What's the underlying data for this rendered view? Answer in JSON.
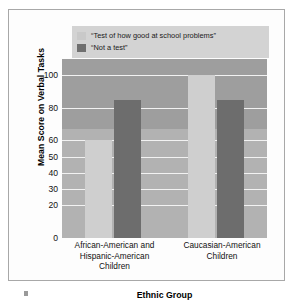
{
  "chart_data": {
    "type": "bar",
    "title": "",
    "xlabel": "Ethnic Group",
    "ylabel": "Mean Score on Verbal Tasks",
    "categories": [
      "African-American and Hispanic-American Children",
      "Caucasian-American Children"
    ],
    "category_lines": [
      [
        "African-American and",
        "Hispanic-American",
        "Children"
      ],
      [
        "Caucasian-American",
        "Children"
      ]
    ],
    "series": [
      {
        "name": "“Test of how good at school problems”",
        "color": "#cfcfcf",
        "values": [
          60,
          100
        ]
      },
      {
        "name": "“Not a test”",
        "color": "#6d6d6d",
        "values": [
          85,
          85
        ]
      }
    ],
    "ylim": [
      0,
      110
    ],
    "yticks": [
      0,
      20,
      30,
      40,
      50,
      60,
      80,
      100
    ],
    "ytick_labels": [
      "0",
      "20",
      "30",
      "40",
      "50",
      "60",
      "80",
      "100"
    ],
    "grid": true,
    "legend_position": "top"
  },
  "legend": {
    "items": [
      {
        "label": "“Test of how good at school problems”",
        "swatch": "light-gray-swatch"
      },
      {
        "label": "“Not a test”",
        "swatch": "dark-gray-swatch"
      }
    ]
  },
  "axes": {
    "y_title": "Mean Score on Verbal Tasks",
    "x_title": "Ethnic Group"
  },
  "colors": {
    "series_light": "#cfcfcf",
    "series_dark": "#6d6d6d",
    "plot_background_upper": "#9e9e9e",
    "plot_background_lower": "#b2b2b2",
    "gridline": "#f2f2f2",
    "legend_background": "#d3d3d3",
    "frame_border": "#a8a8a8"
  }
}
